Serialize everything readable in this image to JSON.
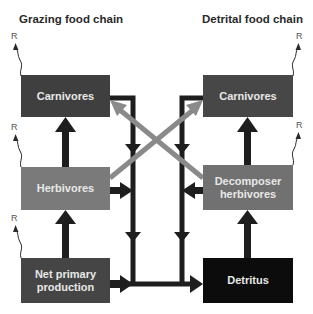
{
  "titles": {
    "left": "Grazing food chain",
    "right": "Detrital food chain"
  },
  "boxes": {
    "grazing_carnivores": {
      "label": "Carnivores",
      "color": "#3f3f3f"
    },
    "herbivores": {
      "label": "Herbivores",
      "color": "#7a7a7a"
    },
    "net_primary_production": {
      "label": "Net primary production",
      "line1": "Net primary",
      "line2": "production",
      "color": "#454545"
    },
    "detrital_carnivores": {
      "label": "Carnivores",
      "color": "#474747"
    },
    "decomposer_herbivores": {
      "label": "Decomposer herbivores",
      "line1": "Decomposer",
      "line2": "herbivores",
      "color": "#717171"
    },
    "detritus": {
      "label": "Detritus",
      "color": "#0c0c0c"
    }
  },
  "respiration_label": "R",
  "colors": {
    "arrow_dark": "#1e1e1e",
    "arrow_cross": "#8a8a8a"
  }
}
